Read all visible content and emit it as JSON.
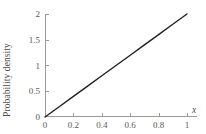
{
  "chart_data": {
    "type": "line",
    "title": "",
    "subtitle": "",
    "xlabel": "x",
    "ylabel": "Probability density",
    "xlim": [
      0,
      1
    ],
    "ylim": [
      0,
      2
    ],
    "grid": false,
    "legend": null,
    "x_ticks": [
      "0",
      "0.2",
      "0.4",
      "0.6",
      "0.8",
      "1"
    ],
    "x_tick_values": [
      0,
      0.2,
      0.4,
      0.6,
      0.8,
      1
    ],
    "y_ticks": [
      "0",
      "0.5",
      "1",
      "1.5",
      "2"
    ],
    "y_tick_values": [
      0,
      0.5,
      1,
      1.5,
      2
    ],
    "series": [
      {
        "name": "f(x) = 2x",
        "x": [
          0,
          0.1,
          0.2,
          0.3,
          0.4,
          0.5,
          0.6,
          0.7,
          0.8,
          0.9,
          1
        ],
        "values": [
          0,
          0.2,
          0.4,
          0.6,
          0.8,
          1.0,
          1.2,
          1.4,
          1.6,
          1.8,
          2.0
        ],
        "color": "#231f20",
        "line_width": 1.4
      }
    ],
    "annotations": [],
    "colors": {
      "axis": "#9b9b9b",
      "tick_label": "#58585a",
      "axis_title": "#4d4d4f",
      "series": "#231f20",
      "background": "#ffffff"
    }
  }
}
